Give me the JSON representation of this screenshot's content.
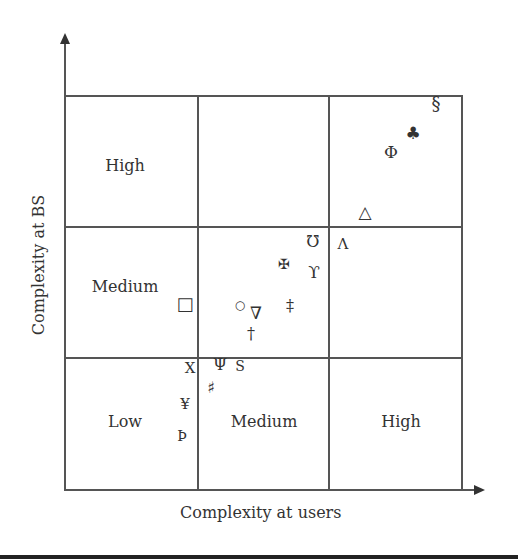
{
  "diagram": {
    "x_axis_label": "Complexity at users",
    "y_axis_label": "Complexity at BS",
    "row_labels": {
      "high": "High",
      "medium": "Medium"
    },
    "col_labels": {
      "low": "Low",
      "medium": "Medium",
      "high": "High"
    },
    "symbols": [
      {
        "id": "section",
        "glyph": "§",
        "x": 436,
        "y": 104,
        "size": 18
      },
      {
        "id": "club",
        "glyph": "♣",
        "x": 413,
        "y": 133,
        "size": 17
      },
      {
        "id": "phi",
        "glyph": "Φ",
        "x": 391,
        "y": 152,
        "size": 17
      },
      {
        "id": "triangle-up",
        "glyph": "△",
        "x": 365,
        "y": 212,
        "size": 17
      },
      {
        "id": "ohm-inverted",
        "glyph": "℧",
        "x": 313,
        "y": 242,
        "size": 16
      },
      {
        "id": "lambda",
        "glyph": "Λ",
        "x": 343,
        "y": 244,
        "size": 15
      },
      {
        "id": "maltese-cross",
        "glyph": "✠",
        "x": 284,
        "y": 264,
        "size": 14
      },
      {
        "id": "upsilon",
        "glyph": "ϒ",
        "x": 314,
        "y": 272,
        "size": 17
      },
      {
        "id": "square",
        "glyph": "□",
        "x": 185,
        "y": 304,
        "size": 18
      },
      {
        "id": "circle",
        "glyph": "○",
        "x": 240,
        "y": 305,
        "size": 12
      },
      {
        "id": "nabla",
        "glyph": "∇",
        "x": 256,
        "y": 313,
        "size": 17
      },
      {
        "id": "double-dagger",
        "glyph": "‡",
        "x": 290,
        "y": 306,
        "size": 16
      },
      {
        "id": "dagger",
        "glyph": "†",
        "x": 251,
        "y": 334,
        "size": 16
      },
      {
        "id": "x",
        "glyph": "X",
        "x": 190,
        "y": 368,
        "size": 15
      },
      {
        "id": "psi",
        "glyph": "Ψ",
        "x": 220,
        "y": 365,
        "size": 16
      },
      {
        "id": "s",
        "glyph": "S",
        "x": 240,
        "y": 366,
        "size": 14
      },
      {
        "id": "sharp",
        "glyph": "♯",
        "x": 211,
        "y": 388,
        "size": 16
      },
      {
        "id": "yen",
        "glyph": "¥",
        "x": 185,
        "y": 404,
        "size": 15
      },
      {
        "id": "thorn",
        "glyph": "Þ",
        "x": 182,
        "y": 436,
        "size": 14
      }
    ]
  }
}
